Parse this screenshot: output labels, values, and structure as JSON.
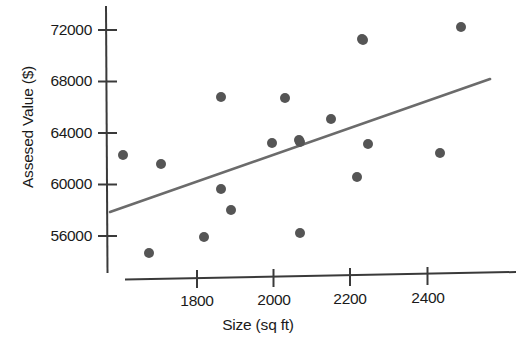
{
  "chart_data": {
    "type": "scatter",
    "title": "",
    "xlabel": "Size (sq ft)",
    "ylabel": "Assesed Value ($)",
    "xlim": [
      1610,
      2630
    ],
    "ylim": [
      52600,
      73500
    ],
    "grid": false,
    "legend": null,
    "x_ticks": [
      1800,
      2000,
      2200,
      2400
    ],
    "y_ticks": [
      56000,
      60000,
      64000,
      68000,
      72000
    ],
    "x_tick_labels": [
      "1800",
      "2000",
      "2200",
      "2400"
    ],
    "y_tick_labels": [
      "56000",
      "60000",
      "64000",
      "68000",
      "72000"
    ],
    "point_color": "#555555",
    "line_color": "#6b6b6b",
    "axis_color": "#3a3a3a",
    "point_radius": 5,
    "series": [
      {
        "name": "Houses",
        "x": [
          1607,
          1709,
          1698,
          1801,
          1847,
          1862,
          1885,
          2000,
          2030,
          2043,
          2058,
          2080,
          2140,
          2175,
          2230,
          2235,
          2252,
          2434,
          2540
        ],
        "y": [
          60900,
          60300,
          54400,
          58200,
          55800,
          66400,
          56400,
          62300,
          66400,
          62300,
          54900,
          62300,
          64300,
          58900,
          59300,
          71300,
          62300,
          61400,
          72400
        ],
        "points_px": [
          [
            123,
            155
          ],
          [
            161,
            164
          ],
          [
            149,
            253
          ],
          [
            204,
            237
          ],
          [
            221,
            189
          ],
          [
            221,
            97
          ],
          [
            231,
            210
          ],
          [
            272,
            143
          ],
          [
            285,
            98
          ],
          [
            300,
            142
          ],
          [
            300,
            233
          ],
          [
            299,
            140
          ],
          [
            331,
            119
          ],
          [
            357,
            177
          ],
          [
            362,
            39
          ],
          [
            368,
            144
          ],
          [
            363,
            40
          ],
          [
            440,
            153
          ],
          [
            461,
            27
          ]
        ]
      }
    ],
    "trend_line": {
      "name": "least-squares fit",
      "x_start": 1571,
      "y_start": 55700,
      "x_end": 2650,
      "y_end": 68100,
      "px_start": [
        110,
        212
      ],
      "px_end": [
        490,
        79
      ]
    }
  }
}
